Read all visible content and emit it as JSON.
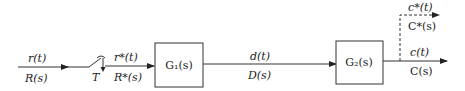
{
  "diagram": {
    "type": "sampled-data control system block diagram",
    "input": {
      "time_label": "r(t)",
      "laplace_label": "R(s)"
    },
    "sampler": {
      "label": "T",
      "time_label": "r*(t)",
      "laplace_label": "R*(s)"
    },
    "block1": {
      "label": "G₁(s)"
    },
    "intermediate": {
      "time_label": "d(t)",
      "laplace_label": "D(s)"
    },
    "block2": {
      "label": "G₂(s)"
    },
    "output": {
      "time_label": "c(t)",
      "laplace_label": "C(s)"
    },
    "sampled_output": {
      "time_label": "c*(t)",
      "laplace_label": "C*(s)"
    }
  }
}
